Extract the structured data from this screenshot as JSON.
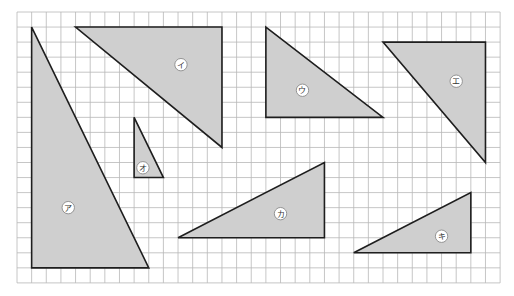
{
  "figure": {
    "grid": {
      "origin_px": [
        17,
        12
      ],
      "cell_px": [
        14.64,
        15.05
      ],
      "columns": 33,
      "rows": 18,
      "line_color": "#b8b8b8"
    },
    "colors": {
      "fill": "#cfcfcf",
      "stroke": "#1e1e1e",
      "label_bg": "#ffffff",
      "label_border": "#8a8a8a",
      "label_text": "#333333"
    },
    "triangles": [
      {
        "id": "a",
        "label": "ア",
        "vertices": [
          [
            1,
            1
          ],
          [
            1,
            17
          ],
          [
            9,
            17
          ]
        ],
        "label_pos": [
          3.5,
          13
        ]
      },
      {
        "id": "i",
        "label": "イ",
        "vertices": [
          [
            4,
            1
          ],
          [
            14,
            1
          ],
          [
            14,
            9
          ]
        ],
        "label_pos": [
          11.2,
          3.5
        ]
      },
      {
        "id": "u",
        "label": "ウ",
        "vertices": [
          [
            17,
            1
          ],
          [
            17,
            7
          ],
          [
            25,
            7
          ]
        ],
        "label_pos": [
          19.5,
          5.2
        ]
      },
      {
        "id": "e",
        "label": "エ",
        "vertices": [
          [
            25,
            2
          ],
          [
            32,
            2
          ],
          [
            32,
            10
          ]
        ],
        "label_pos": [
          30,
          4.6
        ]
      },
      {
        "id": "o",
        "label": "オ",
        "vertices": [
          [
            8,
            7
          ],
          [
            8,
            11
          ],
          [
            10,
            11
          ]
        ],
        "label_pos": [
          8.6,
          10.35
        ]
      },
      {
        "id": "ka",
        "label": "カ",
        "vertices": [
          [
            11,
            15
          ],
          [
            21,
            15
          ],
          [
            21,
            10
          ]
        ],
        "label_pos": [
          18,
          13.4
        ]
      },
      {
        "id": "ki",
        "label": "キ",
        "vertices": [
          [
            23,
            16
          ],
          [
            31,
            16
          ],
          [
            31,
            12
          ]
        ],
        "label_pos": [
          29,
          14.9
        ]
      }
    ]
  }
}
